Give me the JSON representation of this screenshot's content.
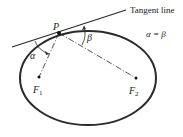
{
  "diagram": {
    "tangent_label": "Tangent line",
    "equation": "α = β",
    "point_label": "P",
    "angle_left": "α",
    "angle_right": "β",
    "focus1": "F",
    "focus1_sub": "1",
    "focus2": "F",
    "focus2_sub": "2"
  },
  "colors": {
    "stroke": "#2a2a2a",
    "text": "#222222"
  }
}
